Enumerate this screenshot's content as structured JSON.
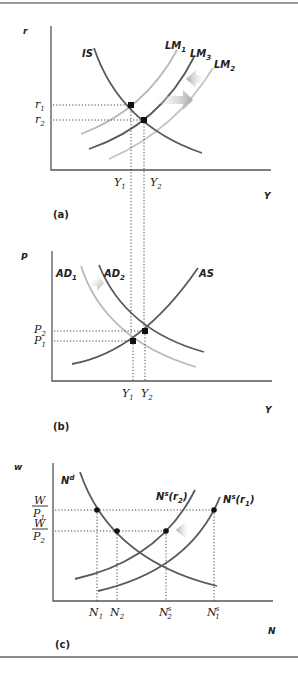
{
  "figure": {
    "panels": [
      {
        "id": "a",
        "label": "(a)",
        "y_axis": "r",
        "x_axis": "Y",
        "curves": [
          "IS",
          "LM1",
          "LM3",
          "LM2"
        ],
        "ticks_y": [
          "r1",
          "r2"
        ],
        "ticks_x": [
          "Y1",
          "Y2"
        ]
      },
      {
        "id": "b",
        "label": "(b)",
        "y_axis": "P",
        "x_axis": "Y",
        "curves": [
          "AD1",
          "AD2",
          "AS"
        ],
        "ticks_y": [
          "P2",
          "P1"
        ],
        "ticks_x": [
          "Y1",
          "Y2"
        ]
      },
      {
        "id": "c",
        "label": "(c)",
        "y_axis": "w",
        "x_axis": "N",
        "curves": [
          "Nd",
          "Ns(r2)",
          "Ns(r1)"
        ],
        "ticks_y": [
          "W/P1",
          "W/P2"
        ],
        "ticks_x": [
          "N1",
          "N2",
          "N2s",
          "N1s"
        ]
      }
    ]
  },
  "panel_a": {
    "label": "(a)",
    "y_axis_label": "r",
    "x_axis_label": "Y",
    "is_label": "IS",
    "lm1": {
      "base": "LM",
      "sub": "1"
    },
    "lm3": {
      "base": "LM",
      "sub": "3"
    },
    "lm2": {
      "base": "LM",
      "sub": "2"
    },
    "r1": {
      "base": "r",
      "sub": "1"
    },
    "r2": {
      "base": "r",
      "sub": "2"
    },
    "y1": {
      "base": "Y",
      "sub": "1"
    },
    "y2": {
      "base": "Y",
      "sub": "2"
    }
  },
  "panel_b": {
    "label": "(b)",
    "y_axis_label": "P",
    "x_axis_label": "Y",
    "ad1": {
      "base": "AD",
      "sub": "1"
    },
    "ad2": {
      "base": "AD",
      "sub": "2"
    },
    "as_label": "AS",
    "p2": {
      "base": "P",
      "sub": "2"
    },
    "p1": {
      "base": "P",
      "sub": "1"
    },
    "y1": {
      "base": "Y",
      "sub": "1"
    },
    "y2": {
      "base": "Y",
      "sub": "2"
    }
  },
  "panel_c": {
    "label": "(c)",
    "y_axis_label": "w",
    "x_axis_label": "N",
    "nd": {
      "base": "N",
      "sup": "d"
    },
    "ns_r2": {
      "base": "N",
      "sup": "s",
      "arg": "(r",
      "argsub": "2",
      "close": ")"
    },
    "ns_r1": {
      "base": "N",
      "sup": "s",
      "arg": "(r",
      "argsub": "1",
      "close": ")"
    },
    "wp1": {
      "num": "W",
      "den": "P",
      "densub": "1"
    },
    "wp2": {
      "num": "W",
      "den": "P",
      "densub": "2"
    },
    "n1": {
      "base": "N",
      "sub": "1"
    },
    "n2": {
      "base": "N",
      "sub": "2"
    },
    "n2s": {
      "base": "N",
      "sup": "s",
      "sub": "2"
    },
    "n1s": {
      "base": "N",
      "sup": "s",
      "sub": "1"
    }
  },
  "colors": {
    "dark_curve": "#5a5a5a",
    "light_curve": "#b9b9b9",
    "axis": "#555555",
    "arrow": "#b5b5b5"
  }
}
